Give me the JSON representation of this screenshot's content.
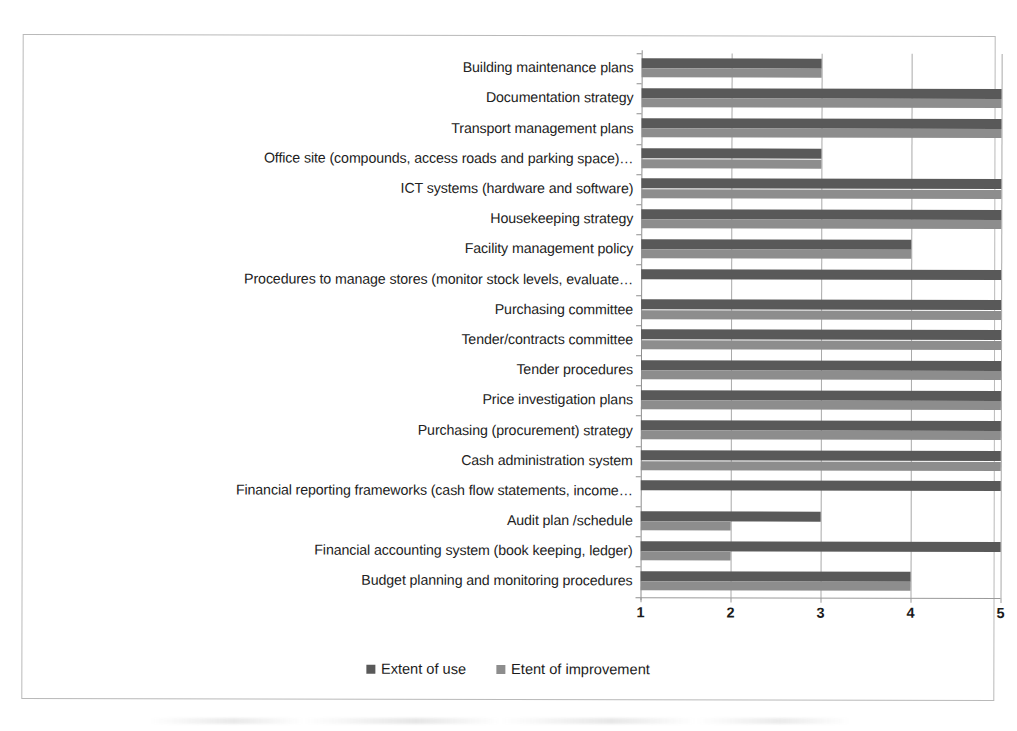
{
  "chart_data": {
    "type": "bar",
    "orientation": "horizontal",
    "title": "",
    "xlabel": "",
    "ylabel": "",
    "xlim": [
      1,
      5
    ],
    "xticks": [
      "1",
      "2",
      "3",
      "4",
      "5"
    ],
    "grid": true,
    "legend_position": "bottom",
    "categories": [
      "Building maintenance plans",
      "Documentation strategy",
      "Transport management plans",
      "Office site (compounds, access roads and parking space)…",
      "ICT systems (hardware and software)",
      "Housekeeping strategy",
      "Facility management policy",
      "Procedures to manage stores (monitor stock levels, evaluate…",
      "Purchasing committee",
      "Tender/contracts committee",
      "Tender procedures",
      "Price investigation plans",
      "Purchasing (procurement) strategy",
      "Cash administration system",
      "Financial reporting frameworks (cash flow statements, income…",
      "Audit plan /schedule",
      "Financial accounting system (book keeping, ledger)",
      "Budget planning and monitoring procedures"
    ],
    "series": [
      {
        "name": "Extent of use",
        "color": "#595959",
        "values": [
          3,
          5,
          5,
          3,
          5,
          5,
          4,
          5,
          5,
          5,
          5,
          5,
          5,
          5,
          5,
          3,
          5,
          4
        ]
      },
      {
        "name": "Etent of improvement",
        "color": "#8d8d8d",
        "values": [
          3,
          5,
          5,
          3,
          5,
          5,
          4,
          1,
          5,
          5,
          5,
          5,
          5,
          5,
          1,
          2,
          2,
          4
        ]
      }
    ]
  },
  "legend": {
    "items": [
      {
        "label": "Extent of use",
        "color": "#595959"
      },
      {
        "label": "Etent of improvement",
        "color": "#8d8d8d"
      }
    ]
  }
}
